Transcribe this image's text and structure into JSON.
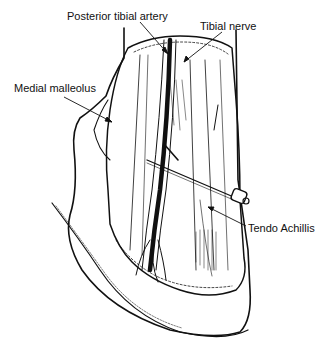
{
  "figure": {
    "labels": [
      {
        "id": "posterior-tibial-artery",
        "text": "Posterior tibial artery",
        "x": 67,
        "y": 10
      },
      {
        "id": "tibial-nerve",
        "text": "Tibial nerve",
        "x": 200,
        "y": 20
      },
      {
        "id": "medial-malleolus",
        "text": "Medial malleolus",
        "x": 14,
        "y": 82
      },
      {
        "id": "tendo-achillis",
        "text": "Tendo Achillis",
        "x": 248,
        "y": 222
      }
    ],
    "colors": {
      "ink": "#111111",
      "background": "#ffffff"
    }
  }
}
